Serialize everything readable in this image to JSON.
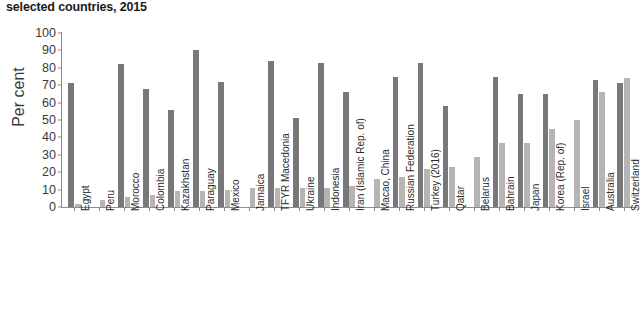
{
  "chart_data": {
    "type": "bar",
    "title": "selected countries, 2015",
    "xlabel": "",
    "ylabel": "Per cent",
    "ylim": [
      0,
      100
    ],
    "yticks": [
      0,
      10,
      20,
      30,
      40,
      50,
      60,
      70,
      80,
      90,
      100
    ],
    "grid": false,
    "legend": "none",
    "categories": [
      "Egypt",
      "Peru",
      "Morocco",
      "Colombia",
      "Kazakhstan",
      "Paraguay",
      "Mexico",
      "Jamaica",
      "TFYR Macedonia",
      "Ukraine",
      "Indonesia",
      "Iran (Islamic Rep. of)",
      "Macao, China",
      "Russian Federation",
      "Turkey (2016)",
      "Qatar",
      "Belarus",
      "Bahrain",
      "Japan",
      "Korea (Rep. of)",
      "Israel",
      "Australia",
      "Switzerland"
    ],
    "series": [
      {
        "name": "dark-series",
        "color": "#787878",
        "values": [
          71,
          0,
          82,
          68,
          56,
          90,
          72,
          0,
          84,
          51,
          83,
          66,
          0,
          75,
          83,
          58,
          0,
          75,
          65,
          65,
          0,
          73,
          71
        ]
      },
      {
        "name": "light-series",
        "color": "#b5b5b5",
        "values": [
          2,
          4,
          6,
          7,
          9,
          9,
          10,
          11,
          11,
          11,
          11,
          12,
          16,
          17,
          22,
          23,
          29,
          37,
          37,
          45,
          50,
          66,
          74
        ]
      }
    ]
  },
  "colors": {
    "dark_bar": "#787878",
    "light_bar": "#b5b5b5",
    "axis": "#8c8c8c",
    "text": "#2b2b2b",
    "background": "#ffffff"
  }
}
